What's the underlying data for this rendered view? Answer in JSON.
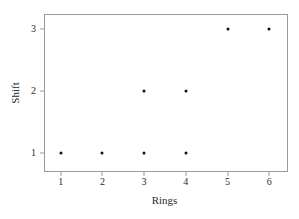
{
  "chart_data": {
    "type": "scatter",
    "title": "",
    "xlabel": "Rings",
    "ylabel": "Shift",
    "xlim": [
      0.6,
      6.45
    ],
    "ylim": [
      0.7,
      3.25
    ],
    "xticks": [
      1,
      2,
      3,
      4,
      5,
      6
    ],
    "xtick_labels": [
      "1",
      "2",
      "3",
      "4",
      "5",
      "6"
    ],
    "yticks": [
      1,
      2,
      3
    ],
    "ytick_labels": [
      "1",
      "2",
      "3"
    ],
    "grid": false,
    "legend": null,
    "marker": {
      "shape": "circle",
      "color": "#111111",
      "size_px": 3
    },
    "frame_color": "#9a9a9a",
    "background": "#ffffff",
    "points": [
      {
        "x": 1,
        "y": 1
      },
      {
        "x": 2,
        "y": 1
      },
      {
        "x": 3,
        "y": 1
      },
      {
        "x": 4,
        "y": 1
      },
      {
        "x": 3,
        "y": 2
      },
      {
        "x": 4,
        "y": 2
      },
      {
        "x": 5,
        "y": 3
      },
      {
        "x": 6,
        "y": 3
      }
    ]
  }
}
